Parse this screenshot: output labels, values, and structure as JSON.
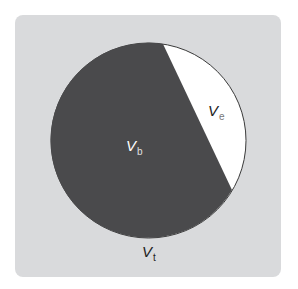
{
  "diagram": {
    "type": "volume partition circle",
    "colors": {
      "background_panel": "#d9dadc",
      "filled_region": "#4a4a4c",
      "empty_region": "#ffffff",
      "outline": "#3a3a3a"
    },
    "regions": [
      {
        "id": "bound",
        "label_main": "V",
        "label_sub": "b",
        "fill": "dark"
      },
      {
        "id": "empty",
        "label_main": "V",
        "label_sub": "e",
        "fill": "white"
      }
    ],
    "total_label": {
      "label_main": "V",
      "label_sub": "t"
    }
  }
}
